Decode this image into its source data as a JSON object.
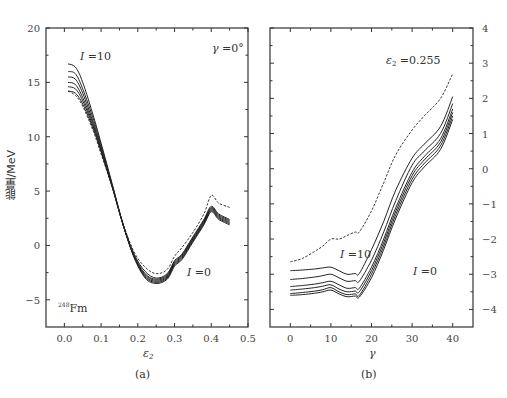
{
  "chart_data": [
    {
      "type": "line",
      "panel": "(a)",
      "title": "",
      "annotation_top_right": "γ =0°",
      "annotation_top_left": "I =10",
      "annotation_bottom": "I =0",
      "nucleus_label": "248Fm",
      "xlabel": "ε2",
      "ylabel": "能量/MeV",
      "xlim": [
        -0.05,
        0.5
      ],
      "ylim": [
        -7.5,
        20
      ],
      "xticks": [
        "0.0",
        "0.1",
        "0.2",
        "0.3",
        "0.4",
        "0.5"
      ],
      "yticks": [
        "-5",
        "0",
        "5",
        "10",
        "15",
        "20"
      ],
      "grid": false,
      "x": [
        0.01,
        0.03,
        0.05,
        0.08,
        0.1,
        0.13,
        0.16,
        0.19,
        0.22,
        0.25,
        0.28,
        0.3,
        0.32,
        0.35,
        0.38,
        0.4,
        0.42,
        0.45
      ],
      "series": [
        {
          "name": "I=0 (dashed)",
          "style": "dashed",
          "values": [
            14.2,
            13.8,
            12.8,
            10.4,
            8.4,
            5.4,
            2.0,
            -0.6,
            -2.0,
            -2.6,
            -2.2,
            -1.0,
            -0.2,
            1.2,
            2.9,
            4.6,
            3.9,
            3.5
          ]
        },
        {
          "name": "I=2",
          "values": [
            14.2,
            14.0,
            13.0,
            10.6,
            8.6,
            5.4,
            1.9,
            -0.8,
            -2.4,
            -3.0,
            -2.6,
            -1.4,
            -0.8,
            0.8,
            2.4,
            3.6,
            2.9,
            2.4
          ]
        },
        {
          "name": "I=4",
          "values": [
            14.6,
            14.4,
            13.3,
            10.8,
            8.7,
            5.4,
            1.9,
            -0.9,
            -2.6,
            -3.1,
            -2.7,
            -1.5,
            -0.9,
            0.7,
            2.3,
            3.5,
            2.8,
            2.3
          ]
        },
        {
          "name": "I=6",
          "values": [
            15.0,
            14.8,
            13.6,
            11.0,
            8.8,
            5.5,
            1.9,
            -1.0,
            -2.7,
            -3.2,
            -2.8,
            -1.6,
            -1.0,
            0.6,
            2.2,
            3.4,
            2.7,
            2.2
          ]
        },
        {
          "name": "I=8",
          "values": [
            15.5,
            15.3,
            14.0,
            11.2,
            9.0,
            5.5,
            1.9,
            -1.0,
            -2.8,
            -3.3,
            -2.9,
            -1.7,
            -1.1,
            0.5,
            2.1,
            3.3,
            2.6,
            2.1
          ]
        },
        {
          "name": "I=9",
          "values": [
            16.0,
            15.8,
            14.4,
            11.5,
            9.2,
            5.6,
            1.9,
            -1.1,
            -2.9,
            -3.4,
            -3.0,
            -1.8,
            -1.2,
            0.4,
            2.0,
            3.2,
            2.5,
            2.0
          ]
        },
        {
          "name": "I=10",
          "values": [
            16.7,
            16.4,
            15.0,
            11.8,
            9.4,
            5.7,
            1.9,
            -1.1,
            -3.0,
            -3.5,
            -3.1,
            -1.9,
            -1.3,
            0.3,
            1.9,
            3.1,
            2.4,
            1.9
          ]
        }
      ]
    },
    {
      "type": "line",
      "panel": "(b)",
      "title": "",
      "annotation_top": "ε2 =0.255",
      "annotation_mid": "I =10",
      "annotation_bottom": "I =0",
      "xlabel": "γ",
      "ylabel": "",
      "xlim": [
        -5,
        45
      ],
      "ylim": [
        -4.5,
        4
      ],
      "xticks": [
        "0",
        "10",
        "20",
        "30",
        "40"
      ],
      "yticks": [
        "-4",
        "-3",
        "-2",
        "-1",
        "0",
        "1",
        "2",
        "3",
        "4"
      ],
      "yaxis_position": "right",
      "grid": false,
      "x": [
        0,
        3,
        6,
        8,
        10,
        12,
        14,
        16,
        17,
        20,
        23,
        26,
        30,
        33,
        37,
        40
      ],
      "series": [
        {
          "name": "dashed",
          "style": "dashed",
          "values": [
            -2.65,
            -2.55,
            -2.35,
            -2.2,
            -2.0,
            -2.0,
            -1.9,
            -1.8,
            -1.8,
            -1.2,
            -0.4,
            0.4,
            1.1,
            1.5,
            2.0,
            2.7
          ]
        },
        {
          "name": "I=10",
          "values": [
            -2.9,
            -2.88,
            -2.85,
            -2.82,
            -2.8,
            -2.9,
            -3.0,
            -2.98,
            -2.98,
            -2.3,
            -1.5,
            -0.6,
            0.3,
            0.7,
            1.2,
            2.05
          ]
        },
        {
          "name": "I=8",
          "values": [
            -3.15,
            -3.12,
            -3.08,
            -3.04,
            -3.0,
            -3.1,
            -3.2,
            -3.18,
            -3.2,
            -2.6,
            -1.8,
            -0.9,
            0.1,
            0.5,
            1.0,
            1.85
          ]
        },
        {
          "name": "I=6",
          "values": [
            -3.35,
            -3.32,
            -3.28,
            -3.24,
            -3.2,
            -3.3,
            -3.4,
            -3.38,
            -3.4,
            -2.8,
            -2.0,
            -1.1,
            -0.1,
            0.35,
            0.85,
            1.7
          ]
        },
        {
          "name": "I=4",
          "values": [
            -3.45,
            -3.42,
            -3.38,
            -3.34,
            -3.3,
            -3.42,
            -3.5,
            -3.48,
            -3.5,
            -2.9,
            -2.1,
            -1.2,
            -0.2,
            0.25,
            0.75,
            1.6
          ]
        },
        {
          "name": "I=2",
          "values": [
            -3.55,
            -3.52,
            -3.48,
            -3.44,
            -3.38,
            -3.5,
            -3.58,
            -3.56,
            -3.6,
            -3.0,
            -2.2,
            -1.3,
            -0.3,
            0.15,
            0.65,
            1.5
          ]
        },
        {
          "name": "I=0",
          "values": [
            -3.6,
            -3.58,
            -3.54,
            -3.5,
            -3.45,
            -3.56,
            -3.64,
            -3.62,
            -3.65,
            -3.1,
            -2.3,
            -1.4,
            -0.4,
            0.05,
            0.55,
            1.4
          ]
        }
      ]
    }
  ],
  "captions": {
    "a": "(a)",
    "b": "(b)"
  },
  "labels": {
    "ylabel_a": "能量/MeV",
    "xlabel_a": "ε",
    "xlabel_a_sub": "2",
    "xlabel_b": "γ",
    "gamma_ann": "γ =0°",
    "I10_a": "I =10",
    "I0_a": "I =0",
    "fm_sup": "248",
    "fm": "Fm",
    "eps_ann": "ε",
    "eps_ann_sub": "2",
    "eps_ann_val": " =0.255",
    "I10_b": "I =10",
    "I0_b": "I =0"
  }
}
